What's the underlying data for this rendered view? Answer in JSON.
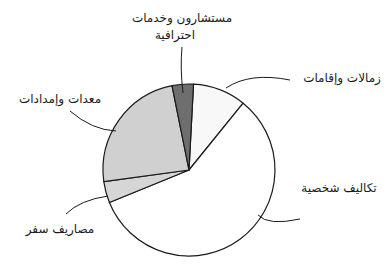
{
  "chart_data": {
    "type": "pie",
    "title": "",
    "start_angle_deg": 3,
    "direction": "clockwise",
    "center": [
      189,
      170
    ],
    "radius": 86,
    "slices": [
      {
        "label": "زمالات وإقامات",
        "value": 10,
        "color": "#f8f8f8"
      },
      {
        "label": "تكاليف شخصية",
        "value": 58,
        "color": "#ffffff"
      },
      {
        "label": "مصاريف سفر",
        "value": 4,
        "color": "#d6d6d6"
      },
      {
        "label": "معدات وإمدادات",
        "value": 24,
        "color": "#d0d0d0"
      },
      {
        "label": "مستشارون وخدمات احترافية",
        "value": 4,
        "color": "#6e6e6e"
      }
    ],
    "legend": "none (callout labels with curved leader lines)"
  },
  "labels": {
    "fellowships": {
      "text": "زمالات وإقامات",
      "x": 298,
      "y": 70,
      "w": 88
    },
    "personal": {
      "text": "تكاليف شخصية",
      "x": 290,
      "y": 180,
      "w": 98
    },
    "travel": {
      "text": "مصاريف سفر",
      "x": 18,
      "y": 221,
      "w": 84
    },
    "equipment": {
      "text": "معدات وإمدادات",
      "x": 12,
      "y": 91,
      "w": 96
    },
    "consultants_line1": {
      "text": "مستشارون وخدمات",
      "x": 122,
      "y": 10,
      "w": 120
    },
    "consultants_line2": {
      "text": "احترافية",
      "x": 122,
      "y": 27,
      "w": 106
    }
  },
  "leaders": [
    {
      "name": "fellowships",
      "d": "M 226 88 Q 250 72 290 80"
    },
    {
      "name": "personal",
      "d": "M 258 215 Q 268 226 300 219"
    },
    {
      "name": "travel",
      "d": "M 108 196 Q 80 200 66 214"
    },
    {
      "name": "equipment",
      "d": "M 116 131 Q 92 130 70 111"
    },
    {
      "name": "consultants",
      "d": "M 183 93 Q 180 68 182 47"
    }
  ],
  "style": {
    "stroke": "#1a1a1a"
  }
}
